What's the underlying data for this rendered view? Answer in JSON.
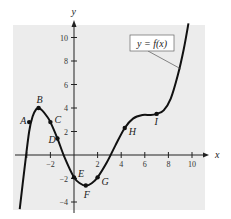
{
  "chart_data": {
    "type": "line",
    "title": "",
    "xlabel": "x",
    "ylabel": "y",
    "xlim": [
      -4.8,
      11.5
    ],
    "ylim": [
      -4.6,
      11.5
    ],
    "x_ticks": [
      -2,
      2,
      4,
      6,
      8,
      10
    ],
    "y_ticks": [
      -4,
      -2,
      2,
      4,
      6,
      8,
      10
    ],
    "x_tick_labels": [
      "-2",
      "2",
      "4",
      "6",
      "8",
      "10"
    ],
    "y_tick_labels": [
      "-4",
      "-2",
      "2",
      "4",
      "6",
      "8",
      "10"
    ],
    "grid": false,
    "legend": {
      "label": "y = f(x)",
      "position": "upper right"
    },
    "series": [
      {
        "name": "y = f(x)",
        "x": [
          -4.6,
          -4.2,
          -3.8,
          -3.5,
          -3.2,
          -3.0,
          -2.7,
          -2.3,
          -2.0,
          -1.4,
          -0.8,
          0.0,
          0.5,
          1.0,
          1.5,
          2.0,
          2.8,
          3.5,
          4.3,
          5.0,
          5.8,
          6.5,
          7.0,
          7.6,
          8.2,
          8.8,
          9.3,
          9.7
        ],
        "values": [
          -4.6,
          -1.2,
          2.0,
          3.3,
          3.9,
          4.0,
          3.8,
          3.3,
          2.8,
          1.4,
          -0.2,
          -1.9,
          -2.4,
          -2.6,
          -2.4,
          -1.9,
          -0.6,
          0.8,
          2.3,
          3.1,
          3.4,
          3.4,
          3.5,
          3.8,
          4.8,
          6.8,
          9.0,
          11.2
        ]
      }
    ],
    "points": [
      {
        "label": "A",
        "x": -3.8,
        "y": 2.8
      },
      {
        "label": "B",
        "x": -3.0,
        "y": 4.0
      },
      {
        "label": "C",
        "x": -2.0,
        "y": 2.8
      },
      {
        "label": "D",
        "x": -1.4,
        "y": 1.4
      },
      {
        "label": "E",
        "x": 0.0,
        "y": -1.9
      },
      {
        "label": "F",
        "x": 1.0,
        "y": -2.6
      },
      {
        "label": "G",
        "x": 2.0,
        "y": -1.9
      },
      {
        "label": "H",
        "x": 4.3,
        "y": 2.3
      },
      {
        "label": "I",
        "x": 7.0,
        "y": 3.5
      }
    ]
  },
  "colors": {
    "panel": "#ececec",
    "curve": "#111111",
    "axis": "#222222"
  }
}
